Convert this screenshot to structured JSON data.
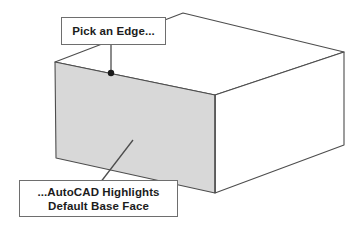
{
  "illustration": {
    "title": "AutoCAD solid box edge pick illustration",
    "background_color": "#ffffff",
    "line_color": "#4d4d4d",
    "shaded_face_color": "#d8d8d8",
    "callout_border_color": "#6e6e6e",
    "callout_background_color": "#ffffff",
    "text_color": "#1c1c1c",
    "pick_point_color": "#1a1a1a"
  },
  "callouts": [
    {
      "id": "pick-edge",
      "lines": [
        "Pick an Edge..."
      ],
      "box": {
        "x": 61,
        "y": 17,
        "width": 105,
        "height": 28
      }
    },
    {
      "id": "highlight",
      "lines": [
        "...AutoCAD Highlights",
        "Default Base Face"
      ],
      "box": {
        "x": 19,
        "y": 180,
        "width": 159,
        "height": 37
      }
    }
  ],
  "text": {
    "pick_edge": "Pick an Edge...",
    "highlight_line1": "...AutoCAD Highlights",
    "highlight_line2": "Default Base Face"
  },
  "geometry": {
    "front_face_vertices": [
      [
        55,
        62
      ],
      [
        215,
        95
      ],
      [
        215,
        193
      ],
      [
        56,
        158
      ]
    ],
    "top_face_vertices": [
      [
        55,
        62
      ],
      [
        183,
        13
      ],
      [
        344,
        52
      ],
      [
        215,
        95
      ]
    ],
    "right_face_vertices": [
      [
        215,
        95
      ],
      [
        344,
        52
      ],
      [
        344,
        145
      ],
      [
        215,
        193
      ]
    ],
    "pick_point": {
      "x": 111,
      "y": 73,
      "radius": 3.2
    },
    "leader_pick_edge": [
      [
        111,
        45
      ],
      [
        111,
        73
      ]
    ],
    "leader_highlight": [
      [
        100,
        183
      ],
      [
        133,
        140
      ]
    ]
  }
}
